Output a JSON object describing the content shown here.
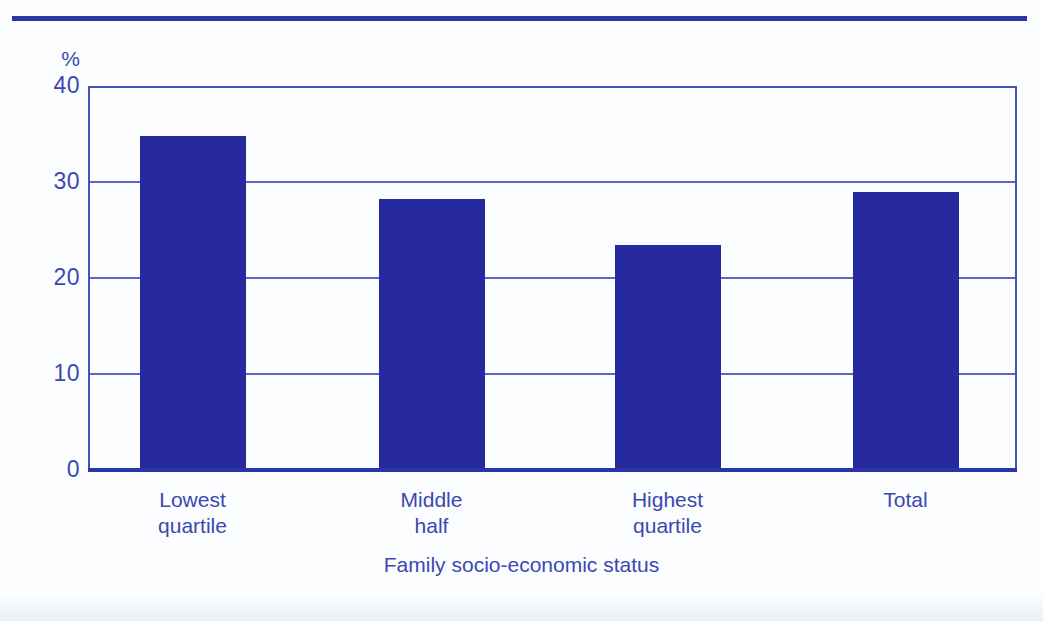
{
  "chart_data": {
    "type": "bar",
    "title": "",
    "subtitle": "",
    "xlabel": "Family socio-economic status",
    "ylabel": "%",
    "categories": [
      "Lowest quartile",
      "Middle half",
      "Highest quartile",
      "Total"
    ],
    "category_lines": [
      [
        "Lowest",
        "quartile"
      ],
      [
        "Middle",
        "half"
      ],
      [
        "Highest",
        "quartile"
      ],
      [
        "Total"
      ]
    ],
    "values": [
      34.6,
      28.0,
      23.2,
      28.8
    ],
    "ylim": [
      0,
      40
    ],
    "yticks": [
      0,
      10,
      20,
      30,
      40
    ],
    "ytick_labels": [
      "0",
      "10",
      "20",
      "30",
      "40"
    ],
    "grid": true,
    "grid_axis": "y",
    "legend": "none",
    "bar_color": "#262a9e",
    "grid_color": "#5a68c4",
    "axis_color": "#2a35a8",
    "text_color": "#3a48b4",
    "background_color": "#fbfdfe"
  },
  "axis": {
    "y_unit_label": "%",
    "x_title": "Family socio-economic status"
  }
}
